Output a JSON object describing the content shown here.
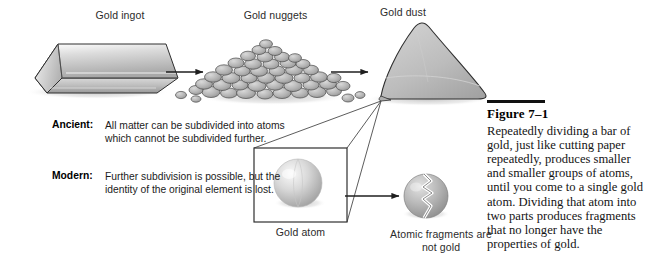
{
  "figure": {
    "labels": {
      "gold_ingot": "Gold ingot",
      "gold_nuggets": "Gold nuggets",
      "gold_dust": "Gold dust",
      "gold_atom": "Gold atom",
      "atomic_fragments": "Atomic fragments are not gold"
    },
    "statements": [
      {
        "term": "Ancient:",
        "text": "All matter can be subdivided into atoms which cannot be subdivided further."
      },
      {
        "term": "Modern:",
        "text": "Further subdivision is possible, but the identity of the original element is lost."
      }
    ],
    "caption": {
      "heading": "Figure 7–1",
      "body": "Repeatedly dividing a bar of gold, just like cutting paper repeatedly, produces smaller and smaller groups of atoms, until you come to a single gold atom. Dividing that atom into two parts produces fragments that no longer have the properties of gold."
    },
    "colors": {
      "outline": "#2f2f2f",
      "metal_light": "#e6e6e6",
      "metal_mid": "#bdbdbd",
      "metal_dark": "#8f8f8f",
      "shadow": "#c9c9c9",
      "text": "#1c1c1c",
      "rule": "#111111"
    }
  }
}
